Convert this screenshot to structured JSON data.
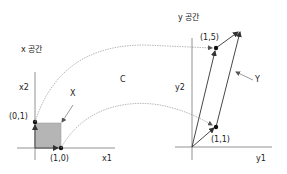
{
  "diagram": {
    "x_space": {
      "title": "x 공간",
      "axis_h_label": "x1",
      "axis_v_label": "x2",
      "region_label": "X",
      "point_a_label": "(0,1)",
      "point_b_label": "(1,0)",
      "region_fill": "#b5b5b5"
    },
    "mapping_label": "C",
    "y_space": {
      "title": "y 공간",
      "axis_h_label": "y1",
      "axis_v_label": "y2",
      "region_label": "Y",
      "point_a_label": "(1,5)",
      "point_b_label": "(1,1)"
    },
    "colors": {
      "axis": "#777777",
      "curve": "#999999",
      "arrow": "#333333",
      "point": "#111111"
    }
  }
}
